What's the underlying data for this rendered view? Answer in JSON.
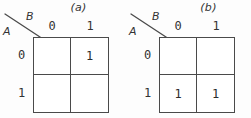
{
  "figures": [
    {
      "title": "(a)",
      "corner": {
        "row_variable": "A",
        "column_variable": "B",
        "separator": "diagonal-line"
      },
      "column_headers": [
        "0",
        "1"
      ],
      "row_headers": [
        "0",
        "1"
      ],
      "cells": [
        [
          "",
          "1"
        ],
        [
          "",
          ""
        ]
      ]
    },
    {
      "title": "(b)",
      "corner": {
        "row_variable": "A",
        "column_variable": "B",
        "separator": "diagonal-line"
      },
      "column_headers": [
        "0",
        "1"
      ],
      "row_headers": [
        "0",
        "1"
      ],
      "cells": [
        [
          "",
          ""
        ],
        [
          "1",
          "1"
        ]
      ]
    }
  ],
  "colors": {
    "background": "#fdfdfd",
    "grid_line": "#4a4a4a",
    "text": "#2b2b2b",
    "cell_fill": "#ffffff"
  }
}
